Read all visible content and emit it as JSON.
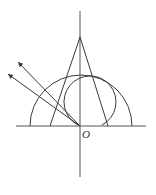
{
  "diagram": {
    "type": "geometry-optics-diagram",
    "origin_label": "O",
    "stroke_color": "#3a3a3a",
    "elements": {
      "horizontal_axis": {
        "x1": 16,
        "y1": 126,
        "x2": 146,
        "y2": 126
      },
      "vertical_axis": {
        "x1": 80,
        "y1": 11,
        "x2": 80,
        "y2": 177
      },
      "triangle": {
        "apex": [
          80,
          37
        ],
        "base_left": [
          50,
          126
        ],
        "base_right": [
          108,
          126
        ]
      },
      "large_semicircle": {
        "center": [
          81,
          126
        ],
        "radius": 51
      },
      "small_circle_arc": {
        "center": [
          90,
          102
        ],
        "radius": 26
      },
      "rays": [
        {
          "from": [
            80,
            126
          ],
          "to": [
            18,
            62
          ],
          "arrow": true
        },
        {
          "from": [
            80,
            126
          ],
          "to": [
            8,
            74
          ],
          "arrow": true
        }
      ]
    }
  }
}
